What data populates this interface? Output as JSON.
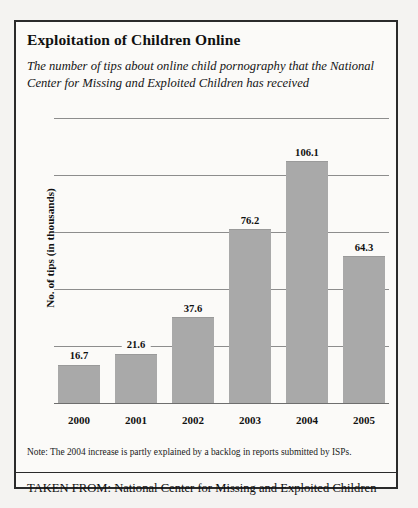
{
  "figure": {
    "title": "Exploitation of Children Online",
    "subtitle": "The number of tips about online child pornography that the National Center for Missing and Exploited Children has received",
    "note": "Note: The 2004 increase is partly explained by a backlog in reports submitted by ISPs.",
    "source": "TAKEN FROM: National Center for Missing and Exploited Children",
    "border_color": "#2b2b2b",
    "page_background": "#f4f3f1"
  },
  "chart_data": {
    "type": "bar",
    "title": "Exploitation of Children Online",
    "subtitle": "The number of tips about online child pornography that the National Center for Missing and Exploited Children has received",
    "categories": [
      "2000",
      "2001",
      "2002",
      "2003",
      "2004",
      "2005"
    ],
    "values": [
      16.7,
      21.6,
      37.6,
      76.2,
      106.1,
      64.3
    ],
    "labels": [
      "16.7",
      "21.6",
      "37.6",
      "76.2",
      "106.1",
      "64.3"
    ],
    "xlabel": "",
    "ylabel": "No. of tips (in thousands)",
    "ylim": [
      0,
      125
    ],
    "yticks": [
      25,
      50,
      75,
      100,
      125
    ],
    "grid": true,
    "legend": false,
    "bar_color": "#a9a9a9",
    "gridline_color": "#8d8d8d",
    "axis_color": "#6e6e6e"
  }
}
